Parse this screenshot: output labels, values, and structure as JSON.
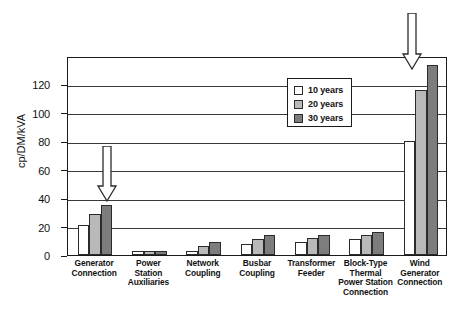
{
  "chart_data": {
    "type": "bar",
    "title": "",
    "subtitle": "",
    "xlabel": "",
    "ylabel": "cp/DM/kVA",
    "ylim": [
      0,
      140
    ],
    "ytick_labels": [
      "0",
      "20",
      "40",
      "60",
      "80",
      "100",
      "120"
    ],
    "ytick_values": [
      0,
      20,
      40,
      60,
      80,
      100,
      120
    ],
    "grid": true,
    "legend_position": "top-center-right",
    "categories": [
      "Generator Connection",
      "Power Station Auxiliaries",
      "Network Coupling",
      "Busbar Coupling",
      "Transformer Feeder",
      "Block-Type Thermal Power Station Connection",
      "Wind Generator Connection"
    ],
    "category_label_lines": [
      [
        "Generator",
        "Connection"
      ],
      [
        "Power",
        "Station",
        "Auxiliaries"
      ],
      [
        "Network",
        "Coupling"
      ],
      [
        "Busbar",
        "Coupling"
      ],
      [
        "Transformer",
        "Feeder"
      ],
      [
        "Block-Type",
        "Thermal",
        "Power Station",
        "Connection"
      ],
      [
        "Wind",
        "Generator",
        "Connection"
      ]
    ],
    "series": [
      {
        "name": "10 years",
        "color": "#ffffff",
        "values": [
          21,
          3,
          3,
          8,
          9,
          11,
          80
        ]
      },
      {
        "name": "20 years",
        "color": "#b9b9b9",
        "values": [
          29,
          3,
          6,
          11,
          12,
          14,
          116
        ]
      },
      {
        "name": "30 years",
        "color": "#7d7d7d",
        "values": [
          35,
          3,
          9,
          14,
          14,
          16.5,
          134
        ]
      }
    ],
    "annotations": [
      {
        "name": "arrow-generator-connection",
        "type": "down-arrow",
        "points_to": "Generator Connection"
      },
      {
        "name": "arrow-wind-generator-connection",
        "type": "down-arrow",
        "points_to": "Wind Generator Connection"
      }
    ]
  },
  "legend": {
    "entries": [
      {
        "label": "10 years"
      },
      {
        "label": "20 years"
      },
      {
        "label": "30 years"
      }
    ]
  },
  "axis": {
    "y_title": "cp/DM/kVA"
  }
}
